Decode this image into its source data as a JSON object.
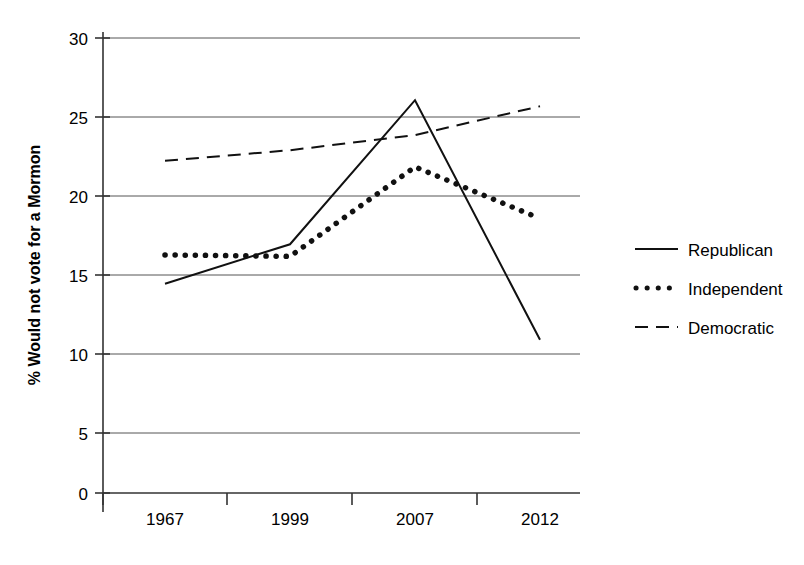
{
  "chart_data": {
    "type": "line",
    "title": "",
    "xlabel": "",
    "ylabel": "% Would not vote for a Mormon",
    "categories": [
      "1967",
      "1999",
      "2007",
      "2012"
    ],
    "ylim": [
      0,
      30
    ],
    "yticks": [
      0,
      5,
      10,
      15,
      20,
      25,
      30
    ],
    "ytick_labels": [
      "0",
      "5",
      "10",
      "15",
      "20",
      "25",
      "30"
    ],
    "grid": true,
    "legend_position": "right",
    "series": [
      {
        "name": "Republican",
        "style": "solid",
        "color": "#111111",
        "values": [
          13.8,
          16.4,
          25.9,
          10.1
        ]
      },
      {
        "name": "Independent",
        "style": "dotted",
        "color": "#111111",
        "values": [
          15.7,
          15.6,
          21.5,
          18.1
        ]
      },
      {
        "name": "Democratic",
        "style": "dashed",
        "color": "#111111",
        "values": [
          21.9,
          22.6,
          23.6,
          25.5
        ]
      }
    ]
  },
  "axis": {
    "y_label": "% Would not vote for a Mormon",
    "y_ticks": [
      "30",
      "25",
      "20",
      "15",
      "10",
      "5",
      "0"
    ],
    "x_ticks": [
      "1967",
      "1999",
      "2007",
      "2012"
    ]
  },
  "legend": {
    "entries": [
      {
        "label": "Republican",
        "marker": "solid-line-swatch"
      },
      {
        "label": "Independent",
        "marker": "dotted-line-swatch"
      },
      {
        "label": "Democratic",
        "marker": "dashed-line-swatch"
      }
    ]
  }
}
